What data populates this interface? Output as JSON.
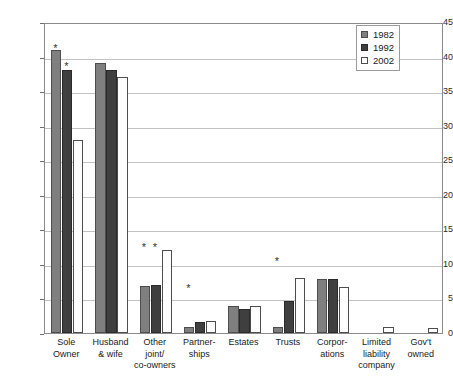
{
  "chart_data": {
    "type": "bar",
    "title": "",
    "xlabel": "",
    "ylabel": "Percentage",
    "ylim": [
      0,
      45
    ],
    "ytick_step": 5,
    "yticks": [
      0,
      5,
      10,
      15,
      20,
      25,
      30,
      35,
      40,
      45
    ],
    "grid": "horizontal",
    "legend_position": "top-right",
    "categories": [
      "Sole Owner",
      "Husband & wife",
      "Other joint/co-owners",
      "Partner-ships",
      "Estates",
      "Trusts",
      "Corpor-ations",
      "Limited liability company",
      "Gov't owned"
    ],
    "category_lines": [
      [
        "Sole",
        "Owner"
      ],
      [
        "Husband",
        "& wife"
      ],
      [
        "Other",
        "joint/",
        "co-owners"
      ],
      [
        "Partner-",
        "ships"
      ],
      [
        "Estates"
      ],
      [
        "Trusts"
      ],
      [
        "Corpor-",
        "ations"
      ],
      [
        "Limited",
        "liability",
        "company"
      ],
      [
        "Gov't",
        "owned"
      ]
    ],
    "series": [
      {
        "name": "1982",
        "color": "#7f7f7f",
        "values": [
          41.0,
          39.0,
          6.8,
          0.9,
          3.9,
          0.8,
          7.8,
          null,
          null
        ]
      },
      {
        "name": "1992",
        "color": "#3f3f3f",
        "values": [
          38.0,
          38.0,
          6.9,
          1.6,
          3.5,
          4.7,
          7.8,
          null,
          null
        ]
      },
      {
        "name": "2002",
        "color": "#ffffff",
        "values": [
          28.0,
          37.0,
          12.0,
          1.7,
          3.9,
          8.0,
          6.6,
          0.8,
          0.7
        ]
      }
    ],
    "annotations": [
      {
        "symbol": "*",
        "category": "Sole Owner",
        "series": "1982",
        "value": 42.0
      },
      {
        "symbol": "*",
        "category": "Sole Owner",
        "series": "1992",
        "value": 39.4
      },
      {
        "symbol": "*",
        "category": "Other joint/co-owners",
        "series": "1982",
        "value": 13.2
      },
      {
        "symbol": "*",
        "category": "Other joint/co-owners",
        "series": "1992",
        "value": 13.2
      },
      {
        "symbol": "*",
        "category": "Partner-ships",
        "series": "1982",
        "value": 7.3
      },
      {
        "symbol": "*",
        "category": "Trusts",
        "series": "1982",
        "value": 11.1
      }
    ]
  },
  "legend": {
    "entries": [
      {
        "label": "1982"
      },
      {
        "label": "1992"
      },
      {
        "label": "2002"
      }
    ]
  }
}
